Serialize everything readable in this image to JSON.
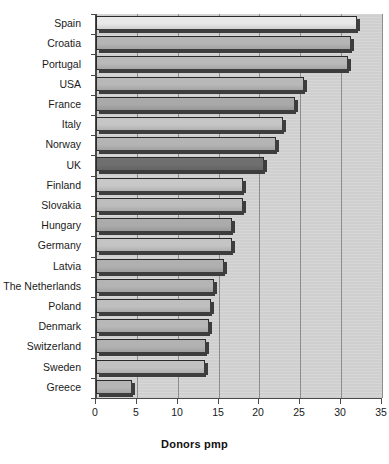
{
  "chart_data": {
    "type": "bar",
    "orientation": "horizontal",
    "title": "",
    "xlabel": "Donors pmp",
    "ylabel": "",
    "xlim": [
      0,
      35
    ],
    "xticks": [
      0,
      5,
      10,
      15,
      20,
      25,
      30,
      35
    ],
    "grid": "vertical",
    "legend": "none",
    "categories": [
      "Spain",
      "Croatia",
      "Portugal",
      "USA",
      "France",
      "Italy",
      "Norway",
      "UK",
      "Finland",
      "Slovakia",
      "Hungary",
      "Germany",
      "Latvia",
      "The Netherlands",
      "Poland",
      "Denmark",
      "Switzerland",
      "Sweden",
      "Greece"
    ],
    "values": [
      32.0,
      31.2,
      30.8,
      25.5,
      24.3,
      22.9,
      22.0,
      20.6,
      18.0,
      18.0,
      16.7,
      16.7,
      15.7,
      14.4,
      14.1,
      13.8,
      13.5,
      13.4,
      4.4
    ],
    "bar_fills": [
      "#e8e8e8",
      "#b5b5b5",
      "#b9b9b9",
      "#b8b8b8",
      "#a9a9a9",
      "#c6c6c6",
      "#b4b4b4",
      "#6f6f6f",
      "#c8c8c8",
      "#bdbdbd",
      "#ababab",
      "#c4c4c4",
      "#b0b0b0",
      "#b4b4b4",
      "#bfbfbf",
      "#b8b8b8",
      "#b2b2b2",
      "#c2c2c2",
      "#b6b6b6"
    ],
    "colors": {
      "panel_background": "#cfcfcf",
      "gridline": "#8d8d8d",
      "axis": "#4a4a4a",
      "bar_outline": "#2b2b2b",
      "bar_shadow": "#3d3d3d",
      "text": "#1a1a1a",
      "figure_background": "#ffffff"
    }
  }
}
